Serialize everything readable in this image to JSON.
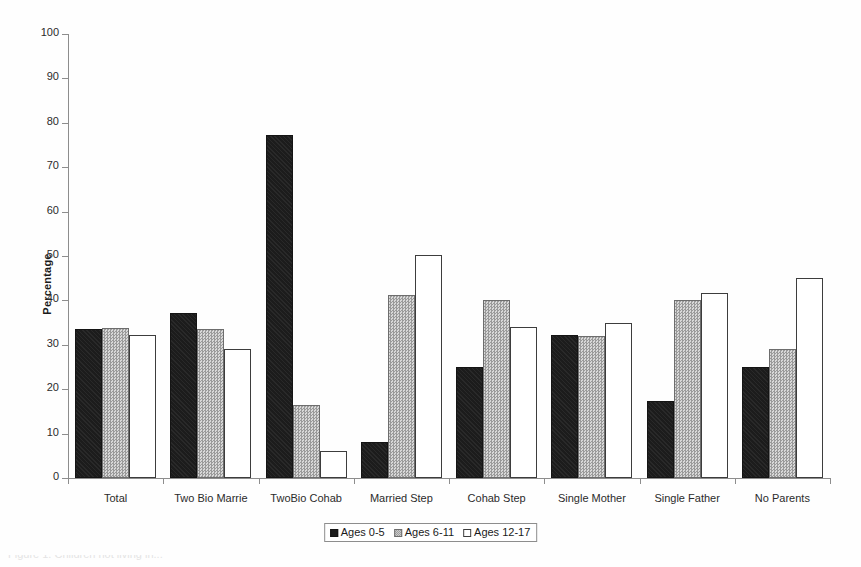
{
  "chart_data": {
    "type": "bar",
    "title": "",
    "xlabel": "",
    "ylabel": "Percentage",
    "ylim": [
      0,
      100
    ],
    "yticks": [
      0,
      10,
      20,
      30,
      40,
      50,
      60,
      70,
      80,
      90,
      100
    ],
    "grid": false,
    "legend_position": "bottom-center",
    "categories": [
      "Total",
      "Two Bio Marrie",
      "TwoBio Cohab",
      "Married Step",
      "Cohab Step",
      "Single Mother",
      "Single Father",
      "No Parents"
    ],
    "series": [
      {
        "name": "Ages 0-5",
        "style": "solid-black",
        "values": [
          33.5,
          37.2,
          77.2,
          8.0,
          25.0,
          32.1,
          17.4,
          25.0
        ]
      },
      {
        "name": "Ages 6-11",
        "style": "hatched-gray",
        "values": [
          33.8,
          33.6,
          16.4,
          41.2,
          40.1,
          31.9,
          40.1,
          29.0
        ]
      },
      {
        "name": "Ages 12-17",
        "style": "open-white",
        "values": [
          32.2,
          29.0,
          6.1,
          50.3,
          34.0,
          34.9,
          41.7,
          45.0
        ]
      }
    ],
    "colors": {
      "series_0": "#1c1c1c",
      "series_1": "#b4b4b4",
      "series_2": "#ffffff",
      "axis": "#8d8d8d",
      "text": "#1a1a1a",
      "background": "#ffffff"
    }
  },
  "legend": {
    "items": [
      {
        "label": "Ages 0-5"
      },
      {
        "label": "Ages 6-11"
      },
      {
        "label": "Ages 12-17"
      }
    ]
  },
  "caption_artifact": "Figure 1. Children not living in..."
}
